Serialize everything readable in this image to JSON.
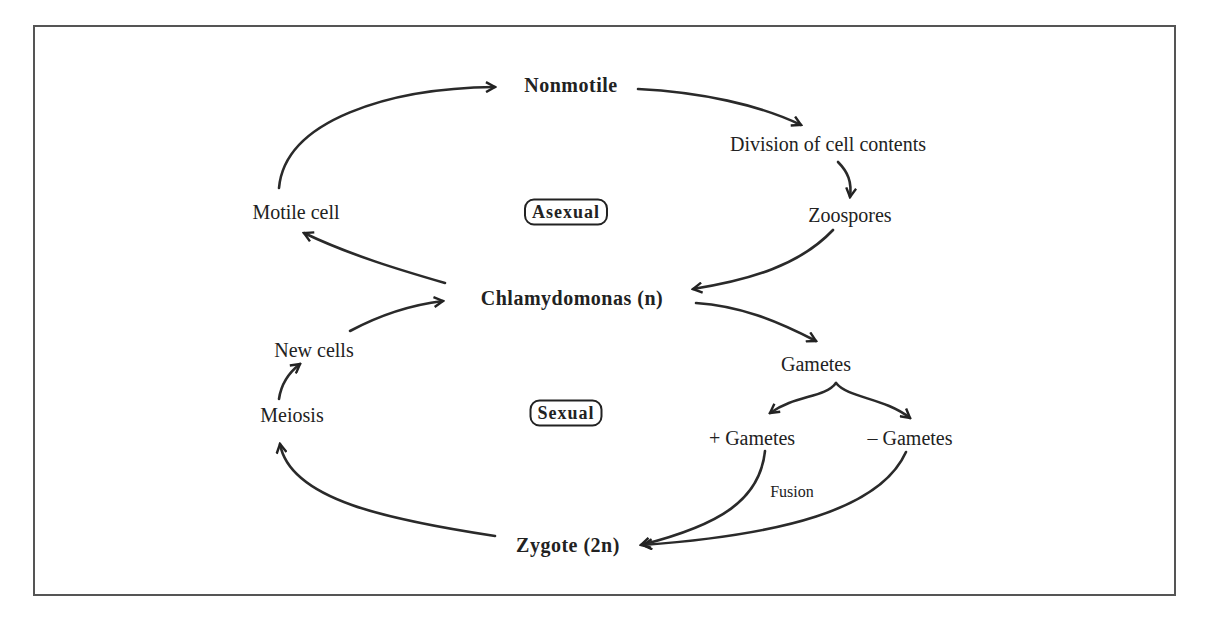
{
  "diagram": {
    "nodes": {
      "nonmotile": "Nonmotile",
      "division": "Division of cell contents",
      "zoospores": "Zoospores",
      "motile_cell": "Motile cell",
      "asexual": "Asexual",
      "chlamydomonas": "Chlamydomonas (n)",
      "new_cells": "New cells",
      "meiosis": "Meiosis",
      "sexual": "Sexual",
      "gametes": "Gametes",
      "plus_gametes": "+ Gametes",
      "minus_gametes": "– Gametes",
      "fusion": "Fusion",
      "zygote": "Zygote (2n)"
    },
    "edges": [
      {
        "from": "Motile cell",
        "to": "Nonmotile"
      },
      {
        "from": "Nonmotile",
        "to": "Division of cell contents"
      },
      {
        "from": "Division of cell contents",
        "to": "Zoospores"
      },
      {
        "from": "Zoospores",
        "to": "Chlamydomonas (n)"
      },
      {
        "from": "Chlamydomonas (n)",
        "to": "Motile cell"
      },
      {
        "from": "Chlamydomonas (n)",
        "to": "Gametes"
      },
      {
        "from": "Gametes",
        "to": "+ Gametes"
      },
      {
        "from": "Gametes",
        "to": "– Gametes"
      },
      {
        "from": "+ Gametes",
        "to": "Zygote (2n)",
        "label": "Fusion"
      },
      {
        "from": "– Gametes",
        "to": "Zygote (2n)",
        "label": "Fusion"
      },
      {
        "from": "Zygote (2n)",
        "to": "Meiosis"
      },
      {
        "from": "Meiosis",
        "to": "New cells"
      },
      {
        "from": "New cells",
        "to": "Chlamydomonas (n)"
      }
    ],
    "colors": {
      "ink": "#222222",
      "frame": "#555555",
      "background": "#ffffff"
    }
  }
}
